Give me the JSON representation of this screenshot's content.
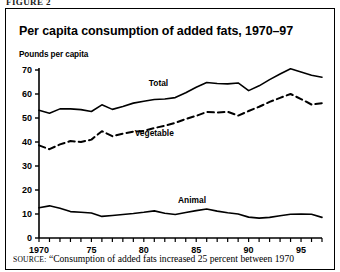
{
  "cut_header": "FIGURE 2",
  "chart_title": "Per capita consumption of added fats, 1970–97",
  "axis_caption": "Pounds per capita",
  "source_prefix": "SOURCE:",
  "source_text": "“Consumption of added fats increased 25 percent between 1970",
  "colors": {
    "line": "#000000",
    "frame": "#000000",
    "background": "#ffffff"
  },
  "chart_data": {
    "type": "line",
    "title": "Per capita consumption of added fats, 1970–97",
    "subtitle": "Pounds per capita",
    "xlabel": "",
    "ylabel": "Pounds per capita",
    "ylim": [
      0,
      70
    ],
    "xlim": [
      1970,
      1997
    ],
    "yticks": [
      0,
      10,
      20,
      30,
      40,
      50,
      60,
      70
    ],
    "ytick_labels": [
      "0",
      "10",
      "20",
      "30",
      "40",
      "50",
      "60",
      "70"
    ],
    "xticks": [
      1970,
      1975,
      1980,
      1985,
      1990,
      1995
    ],
    "xtick_labels": [
      "1970",
      "75",
      "80",
      "85",
      "90",
      "95"
    ],
    "xticks_minor_every": 1,
    "grid": false,
    "legend": "inline-labels",
    "x": [
      1970,
      1971,
      1972,
      1973,
      1974,
      1975,
      1976,
      1977,
      1978,
      1979,
      1980,
      1981,
      1982,
      1983,
      1984,
      1985,
      1986,
      1987,
      1988,
      1989,
      1990,
      1991,
      1992,
      1993,
      1994,
      1995,
      1996,
      1997
    ],
    "series": [
      {
        "name": "Total",
        "style": "solid",
        "label_x": 1981.4,
        "label_y": 63.5,
        "values": [
          53.2,
          52.0,
          53.8,
          53.8,
          53.5,
          52.7,
          55.5,
          53.6,
          54.8,
          56.2,
          57.0,
          57.7,
          57.9,
          58.5,
          60.5,
          62.8,
          64.8,
          64.4,
          64.2,
          64.6,
          61.4,
          63.4,
          66.0,
          68.3,
          70.5,
          69.2,
          67.8,
          67.0
        ]
      },
      {
        "name": "Vegetable",
        "style": "dashed",
        "label_x": 1981.0,
        "label_y": 42.6,
        "values": [
          38.6,
          37.0,
          39.0,
          40.4,
          40.0,
          41.0,
          44.5,
          42.4,
          43.5,
          44.3,
          44.6,
          45.8,
          46.8,
          48.0,
          49.6,
          50.9,
          52.5,
          52.3,
          52.6,
          51.0,
          52.9,
          54.7,
          56.7,
          58.4,
          60.0,
          57.9,
          55.6,
          56.2
        ]
      },
      {
        "name": "Animal",
        "style": "solid",
        "label_x": 1984.6,
        "label_y": 14.4,
        "values": [
          12.6,
          13.4,
          12.4,
          11.0,
          10.7,
          10.4,
          9.0,
          9.4,
          9.8,
          10.2,
          10.7,
          11.3,
          10.3,
          9.8,
          10.6,
          11.4,
          12.1,
          11.2,
          10.5,
          10.0,
          8.7,
          8.3,
          8.6,
          9.3,
          9.9,
          10.0,
          9.9,
          8.6
        ]
      }
    ]
  }
}
